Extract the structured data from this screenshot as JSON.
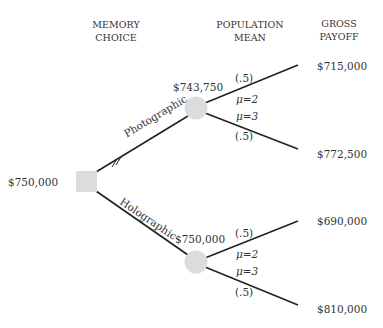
{
  "headers": {
    "memory_choice": [
      "MEMORY",
      "CHOICE"
    ],
    "population_mean": [
      "POPULATION",
      "MEAN"
    ],
    "gross_payoff": [
      "GROSS",
      "PAYOFF"
    ]
  },
  "decision_node": {
    "value": "$750,000",
    "color": "#dcdcdc"
  },
  "branches": {
    "photographic": {
      "label": "Photographic",
      "node_value": "$743,750",
      "outcomes": [
        {
          "prob": "(.5)",
          "mu": "μ=2",
          "payoff": "$715,000"
        },
        {
          "prob": "(.5)",
          "mu": "μ=3",
          "payoff": "$772,500"
        }
      ]
    },
    "holographic": {
      "label": "Holographic",
      "node_value": "$750,000",
      "outcomes": [
        {
          "prob": "(.5)",
          "mu": "μ=2",
          "payoff": "$690,000"
        },
        {
          "prob": "(.5)",
          "mu": "μ=3",
          "payoff": "$810,000"
        }
      ]
    }
  },
  "colors": {
    "line": "#222222",
    "node": "#dcdcdc",
    "text": "#333333"
  }
}
